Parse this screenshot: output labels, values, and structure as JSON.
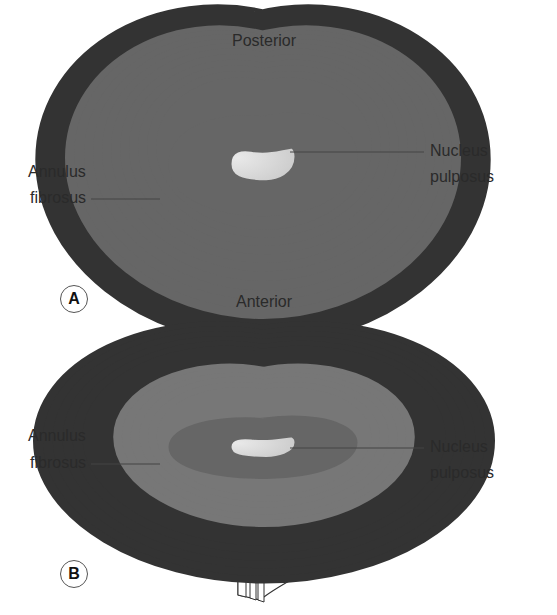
{
  "figure_a": {
    "badge": "A",
    "top_label": "Posterior",
    "bottom_label": "Anterior",
    "left_label_line1": "Annulus",
    "left_label_line2": "fibrosus",
    "right_label_line1": "Nucleus",
    "right_label_line2": "pulposus"
  },
  "figure_b": {
    "badge": "B",
    "left_label_line1": "Annulus",
    "left_label_line2": "fibrosus",
    "right_label_line1": "Nucleus",
    "right_label_line2": "pulposus"
  },
  "colors": {
    "line": "#555555",
    "outline": "#333333",
    "nucleus_fill_light": "#e6e6e6",
    "nucleus_fill_dark": "#bdbdbd",
    "text": "#2a2a2a"
  }
}
